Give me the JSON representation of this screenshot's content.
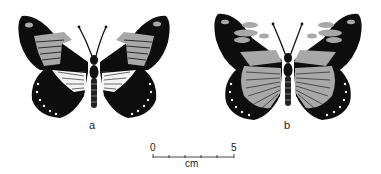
{
  "figure": {
    "panels": [
      {
        "id": "a",
        "label": "a",
        "description": "Butterfly, dorsal view: black wings, grey forewing patch, white hindwing band"
      },
      {
        "id": "b",
        "label": "b",
        "description": "Butterfly, dorsal view: black wings, grey forewing spots, grey-striated hindwing"
      }
    ],
    "scale_bar": {
      "start_label": "0",
      "end_label": "5",
      "unit_label": "cm",
      "ticks": 6
    },
    "colors": {
      "wing_black": "#0d0d0d",
      "patch_grey": "#a8a8a8",
      "band_white": "#f4f4f4",
      "background": "#ffffff"
    }
  }
}
